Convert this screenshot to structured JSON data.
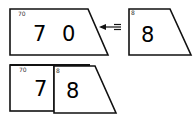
{
  "diagram": {
    "top_row": {
      "left_card": {
        "label": "70",
        "value_digits": [
          "7",
          "0"
        ]
      },
      "arrow": {
        "direction": "left",
        "meaning": "merge-into"
      },
      "right_card": {
        "label": "8",
        "value": "8"
      }
    },
    "bottom_row": {
      "left_card": {
        "label": "70",
        "value": "7"
      },
      "right_card": {
        "label": "8",
        "value": "8"
      }
    }
  },
  "colors": {
    "stroke": "#111111",
    "background": "#ffffff",
    "label": "#333333"
  }
}
